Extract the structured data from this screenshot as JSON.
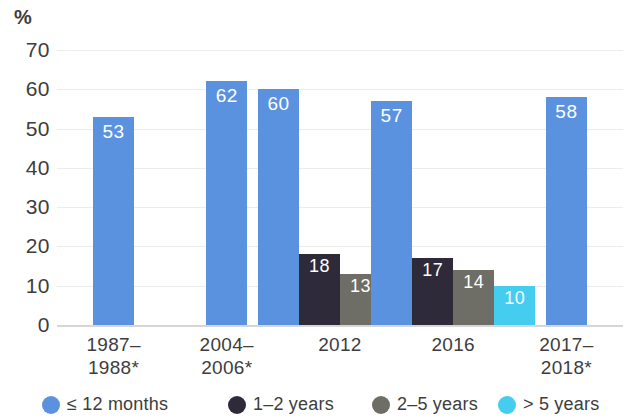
{
  "chart_data": {
    "type": "bar",
    "title": "",
    "subtitle": "",
    "xlabel": "",
    "ylabel": "%",
    "ylim": [
      0,
      70
    ],
    "ytick_step": 10,
    "yticks": [
      "70",
      "60",
      "50",
      "40",
      "30",
      "20",
      "10",
      "0"
    ],
    "grid": true,
    "legend_position": "bottom",
    "categories": [
      "1987–\n1988*",
      "2004–\n2006*",
      "2012",
      "2016",
      "2017–\n2018*"
    ],
    "series": [
      {
        "name": "≤ 12 months",
        "color": "#5a92e0",
        "values": [
          53,
          62,
          60,
          57,
          58
        ]
      },
      {
        "name": "1–2 years",
        "color": "#2e2a3a",
        "values": [
          null,
          null,
          18,
          17,
          null
        ]
      },
      {
        "name": "2–5 years",
        "color": "#6e6e66",
        "values": [
          null,
          null,
          13,
          14,
          null
        ]
      },
      {
        "name": "> 5 years",
        "color": "#45cdf0",
        "values": [
          null,
          null,
          9,
          10,
          null
        ]
      }
    ]
  },
  "axis": {
    "unit_label": "%",
    "ticks": [
      {
        "value": 70,
        "label": "70"
      },
      {
        "value": 60,
        "label": "60"
      },
      {
        "value": 50,
        "label": "50"
      },
      {
        "value": 40,
        "label": "40"
      },
      {
        "value": 30,
        "label": "30"
      },
      {
        "value": 20,
        "label": "20"
      },
      {
        "value": 10,
        "label": "10"
      },
      {
        "value": 0,
        "label": "0"
      }
    ]
  },
  "groups": [
    {
      "id": "g1987",
      "label_line1": "1987–",
      "label_line2": "1988*",
      "bars": [
        {
          "series": "≤ 12 months",
          "value": 53,
          "label": "53",
          "color": "#5a92e0"
        }
      ]
    },
    {
      "id": "g2004",
      "label_line1": "2004–",
      "label_line2": "2006*",
      "bars": [
        {
          "series": "≤ 12 months",
          "value": 62,
          "label": "62",
          "color": "#5a92e0"
        }
      ]
    },
    {
      "id": "g2012",
      "label_line1": "2012",
      "label_line2": "",
      "bars": [
        {
          "series": "≤ 12 months",
          "value": 60,
          "label": "60",
          "color": "#5a92e0"
        },
        {
          "series": "1–2 years",
          "value": 18,
          "label": "18",
          "color": "#2e2a3a"
        },
        {
          "series": "2–5 years",
          "value": 13,
          "label": "13",
          "color": "#6e6e66"
        },
        {
          "series": "> 5 years",
          "value": 9,
          "label": "9",
          "color": "#45cdf0"
        }
      ]
    },
    {
      "id": "g2016",
      "label_line1": "2016",
      "label_line2": "",
      "bars": [
        {
          "series": "≤ 12 months",
          "value": 57,
          "label": "57",
          "color": "#5a92e0"
        },
        {
          "series": "1–2 years",
          "value": 17,
          "label": "17",
          "color": "#2e2a3a"
        },
        {
          "series": "2–5 years",
          "value": 14,
          "label": "14",
          "color": "#6e6e66"
        },
        {
          "series": "> 5 years",
          "value": 10,
          "label": "10",
          "color": "#45cdf0"
        }
      ]
    },
    {
      "id": "g2017",
      "label_line1": "2017–",
      "label_line2": "2018*",
      "bars": [
        {
          "series": "≤ 12 months",
          "value": 58,
          "label": "58",
          "color": "#5a92e0"
        }
      ]
    }
  ],
  "legend": {
    "items": [
      {
        "label": "≤ 12 months",
        "color": "#5a92e0"
      },
      {
        "label": "1–2 years",
        "color": "#2e2a3a"
      },
      {
        "label": "2–5 years",
        "color": "#6e6e66"
      },
      {
        "label": "> 5 years",
        "color": "#45cdf0"
      }
    ]
  }
}
